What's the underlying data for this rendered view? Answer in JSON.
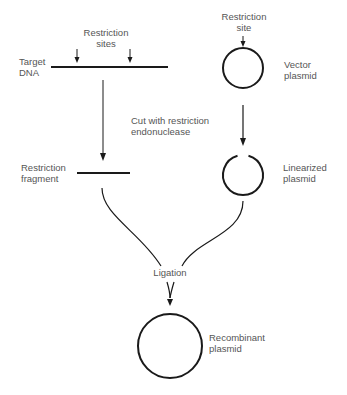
{
  "diagram": {
    "type": "process-flow",
    "colors": {
      "stroke": "#1a1a1a",
      "text": "#555555",
      "background": "#ffffff"
    },
    "labels": {
      "restriction_sites": [
        "Restriction",
        "sites"
      ],
      "target_dna": [
        "Target",
        "DNA"
      ],
      "restriction_site": [
        "Restriction",
        "site"
      ],
      "vector_plasmid": [
        "Vector",
        "plasmid"
      ],
      "cut_step": [
        "Cut with restriction",
        "endonuclease"
      ],
      "restriction_fragment": [
        "Restriction",
        "fragment"
      ],
      "linearized_plasmid": [
        "Linearized",
        "plasmid"
      ],
      "ligation": "Ligation",
      "recombinant_plasmid": [
        "Recombinant",
        "plasmid"
      ]
    },
    "nodes": [
      {
        "id": "target-dna",
        "shape": "line"
      },
      {
        "id": "vector-plasmid",
        "shape": "circle"
      },
      {
        "id": "restriction-fragment",
        "shape": "line"
      },
      {
        "id": "linearized-plasmid",
        "shape": "open-circle"
      },
      {
        "id": "recombinant-plasmid",
        "shape": "circle"
      }
    ],
    "edges": [
      {
        "from": "target-dna",
        "to": "restriction-fragment",
        "label": "Cut with restriction endonuclease"
      },
      {
        "from": "vector-plasmid",
        "to": "linearized-plasmid",
        "label": "Cut with restriction endonuclease"
      },
      {
        "from": "restriction-fragment",
        "to": "recombinant-plasmid",
        "label": "Ligation"
      },
      {
        "from": "linearized-plasmid",
        "to": "recombinant-plasmid",
        "label": "Ligation"
      }
    ]
  }
}
